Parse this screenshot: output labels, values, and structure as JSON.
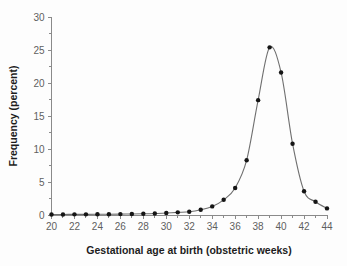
{
  "chart_data": {
    "type": "line",
    "title": "",
    "subtitle": "",
    "xlabel": "Gestational age at birth (obstetric weeks)",
    "ylabel": "Frequency (percent)",
    "xlim": [
      20,
      44
    ],
    "ylim": [
      0,
      30
    ],
    "grid": false,
    "legend": null,
    "marker": "filled-circle",
    "x_tick_labels": [
      "20",
      "22",
      "24",
      "26",
      "28",
      "30",
      "32",
      "34",
      "36",
      "38",
      "40",
      "42",
      "44"
    ],
    "x_ticks": [
      20,
      22,
      24,
      26,
      28,
      30,
      32,
      34,
      36,
      38,
      40,
      42,
      44
    ],
    "x_minor_ticks": [
      21,
      23,
      25,
      27,
      29,
      31,
      33,
      35,
      37,
      39,
      41,
      43
    ],
    "y_tick_labels": [
      "0",
      "5",
      "10",
      "15",
      "20",
      "25",
      "30"
    ],
    "y_ticks": [
      0,
      5,
      10,
      15,
      20,
      25,
      30
    ],
    "y_minor_ticks": [
      2.5,
      7.5,
      12.5,
      17.5,
      22.5,
      27.5
    ],
    "x": [
      20,
      21,
      22,
      23,
      24,
      25,
      26,
      27,
      28,
      29,
      30,
      31,
      32,
      33,
      34,
      35,
      36,
      37,
      38,
      39,
      40,
      41,
      42,
      43,
      44
    ],
    "values": [
      0.08,
      0.08,
      0.1,
      0.1,
      0.12,
      0.12,
      0.14,
      0.16,
      0.18,
      0.22,
      0.3,
      0.4,
      0.5,
      0.8,
      1.3,
      2.3,
      4.1,
      8.3,
      17.4,
      25.4,
      21.6,
      10.8,
      3.6,
      2.0,
      1.0
    ],
    "series": [
      {
        "name": "Gestational age distribution",
        "values": [
          0.08,
          0.08,
          0.1,
          0.1,
          0.12,
          0.12,
          0.14,
          0.16,
          0.18,
          0.22,
          0.3,
          0.4,
          0.5,
          0.8,
          1.3,
          2.3,
          4.1,
          8.3,
          17.4,
          25.4,
          21.6,
          10.8,
          3.6,
          2.0,
          1.0
        ]
      }
    ],
    "colors": {
      "line": "#6f6f6f",
      "marker": "#151515",
      "axis": "#8a8a8a",
      "tick_label": "#5f5f5f",
      "axis_title": "#1d1d1d",
      "background": "#fdfdfd"
    }
  }
}
